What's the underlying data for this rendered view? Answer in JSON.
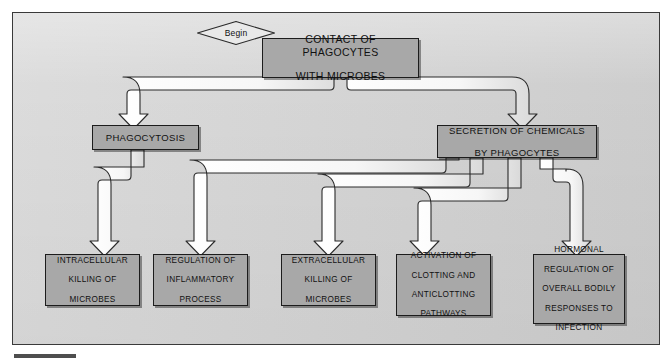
{
  "diagram": {
    "title_flow": "Contact of phagocytes with microbes flowchart",
    "begin_label": "Begin",
    "colors": {
      "page_background": "#ffffff",
      "frame_background": "#d4d4d4",
      "frame_border": "#3a3a3a",
      "box_fill": "#a8a8a8",
      "box_border": "#1c1c1c",
      "connector_fill": "#f4f4f4",
      "connector_stroke": "#2a2a2a",
      "text": "#111111"
    },
    "nodes": {
      "start": {
        "id": "contact-of-phagocytes-with-microbes",
        "label": "CONTACT OF PHAGOCYTES WITH MICROBES",
        "line1": "CONTACT OF PHAGOCYTES",
        "line2": "WITH MICROBES"
      },
      "branch_left": {
        "id": "phagocytosis",
        "label": "PHAGOCYTOSIS"
      },
      "branch_right": {
        "id": "secretion-of-chemicals-by-phagocytes",
        "label": "SECRETION OF CHEMICALS BY PHAGOCYTES",
        "line1": "SECRETION OF CHEMICALS",
        "line2": "BY PHAGOCYTES"
      }
    },
    "outcomes": [
      {
        "id": "intracellular-killing-of-microbes",
        "label": "INTRACELLULAR KILLING OF MICROBES",
        "lines": [
          "INTRACELLULAR",
          "KILLING OF",
          "MICROBES"
        ],
        "source": "phagocytosis"
      },
      {
        "id": "regulation-of-inflammatory-process",
        "label": "REGULATION OF INFLAMMATORY PROCESS",
        "lines": [
          "REGULATION OF",
          "INFLAMMATORY",
          "PROCESS"
        ],
        "source": "secretion-of-chemicals-by-phagocytes"
      },
      {
        "id": "extracellular-killing-of-microbes",
        "label": "EXTRACELLULAR KILLING OF MICROBES",
        "lines": [
          "EXTRACELLULAR",
          "KILLING OF",
          "MICROBES"
        ],
        "source": "secretion-of-chemicals-by-phagocytes"
      },
      {
        "id": "activation-of-clotting-and-anticlotting-pathways",
        "label": "ACTIVATION OF CLOTTING AND ANTICLOTTING PATHWAYS",
        "lines": [
          "ACTIVATION OF",
          "CLOTTING AND",
          "ANTICLOTTING",
          "PATHWAYS"
        ],
        "source": "secretion-of-chemicals-by-phagocytes"
      },
      {
        "id": "hormonal-regulation-of-overall-bodily-responses-to-infection",
        "label": "HORMONAL REGULATION OF OVERALL BODILY RESPONSES TO INFECTION",
        "lines": [
          "HORMONAL",
          "REGULATION OF",
          "OVERALL BODILY",
          "RESPONSES TO",
          "INFECTION"
        ],
        "source": "secretion-of-chemicals-by-phagocytes"
      }
    ]
  }
}
